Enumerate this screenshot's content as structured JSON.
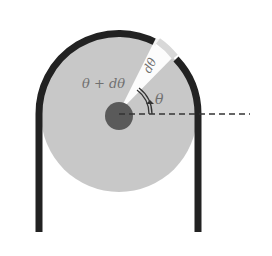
{
  "diagram": {
    "labels": {
      "theta_plus_dtheta": "θ + dθ",
      "dtheta": "dθ",
      "theta": "θ"
    },
    "colors": {
      "disk": "#c8c8c8",
      "hub": "#5a5a5a",
      "rope": "#222222",
      "wedge": "#ffffff",
      "label": "#707070",
      "dashed_line": "#333333"
    }
  }
}
